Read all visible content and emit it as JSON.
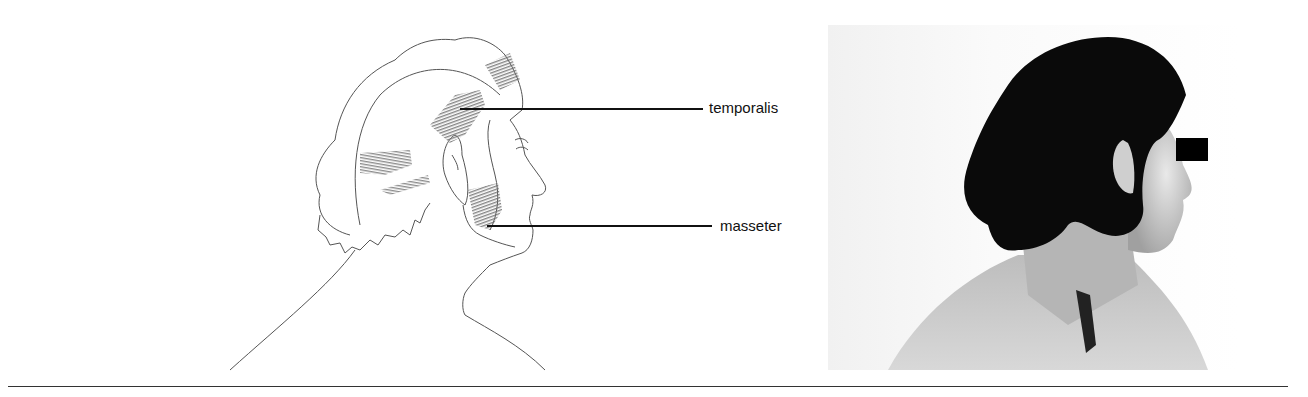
{
  "figure": {
    "labels": {
      "temporalis": "temporalis",
      "masseter": "masseter"
    },
    "drawing_icon": "head-profile-muscle-illustration",
    "photo_icon": "head-profile-photograph",
    "colors": {
      "ink": "#111111",
      "shading": "#7a7a7a",
      "background": "#ffffff",
      "hair": "#0a0a0a",
      "censor_bar": "#000000"
    }
  }
}
